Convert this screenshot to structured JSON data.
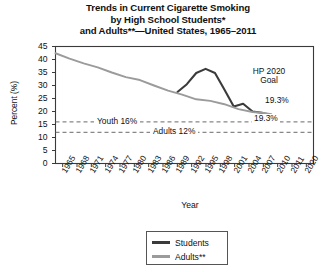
{
  "chart_data": {
    "type": "line",
    "title": "Trends in Current Cigarette Smoking by High School Students* and Adults**—United States, 1965–2011",
    "title_lines": [
      "Trends in Current Cigarette Smoking",
      "by High School Students*",
      "and Adults**—United States, 1965–2011"
    ],
    "xlabel": "Year",
    "ylabel": "Percent (%)",
    "ylim": [
      0,
      45
    ],
    "yticks": [
      0,
      5,
      10,
      15,
      20,
      25,
      30,
      35,
      40,
      45
    ],
    "ytick_labels": [
      "0",
      "5",
      "10",
      "15",
      "20",
      "25",
      "30",
      "35",
      "40",
      "45"
    ],
    "xlim": [
      1965,
      2020
    ],
    "xtick_labels": [
      "1965",
      "1968",
      "1971",
      "1974",
      "1977",
      "1980",
      "1983",
      "1986",
      "1989",
      "1992",
      "1995",
      "1998",
      "2001",
      "2004",
      "2007",
      "2010",
      "2011",
      "2020"
    ],
    "grid": false,
    "legend_position": "bottom-center",
    "series": [
      {
        "name": "Students",
        "color": "#3b3b3b",
        "points": [
          [
            1991,
            27.5
          ],
          [
            1993,
            30.5
          ],
          [
            1995,
            34.8
          ],
          [
            1997,
            36.4
          ],
          [
            1999,
            34.8
          ],
          [
            2001,
            28.5
          ],
          [
            2003,
            21.9
          ],
          [
            2005,
            23.0
          ],
          [
            2007,
            20.0
          ],
          [
            2009,
            19.5
          ],
          [
            2011,
            18.1
          ]
        ]
      },
      {
        "name": "Adults**",
        "color": "#9b9b9b",
        "points": [
          [
            1965,
            42.4
          ],
          [
            1968,
            40.3
          ],
          [
            1971,
            38.5
          ],
          [
            1974,
            37.0
          ],
          [
            1977,
            35.0
          ],
          [
            1980,
            33.2
          ],
          [
            1983,
            32.1
          ],
          [
            1986,
            30.0
          ],
          [
            1989,
            28.0
          ],
          [
            1992,
            26.5
          ],
          [
            1995,
            24.7
          ],
          [
            1998,
            24.1
          ],
          [
            2001,
            22.8
          ],
          [
            2004,
            20.9
          ],
          [
            2007,
            19.8
          ],
          [
            2010,
            19.3
          ],
          [
            2011,
            19.0
          ]
        ]
      }
    ],
    "reference_lines": [
      {
        "label": "Youth 16%",
        "value": 16
      },
      {
        "label": "Adults 12%",
        "value": 12
      }
    ],
    "annotations": [
      {
        "name": "hp-2020-goal",
        "text_lines": [
          "HP 2020",
          "Goal"
        ]
      },
      {
        "name": "students-endpoint-value",
        "text": "19.3%"
      },
      {
        "name": "adults-endpoint-value",
        "text": "19.3%"
      }
    ]
  },
  "legend": {
    "items": [
      {
        "label": "Students",
        "color": "#3b3b3b"
      },
      {
        "label": "Adults**",
        "color": "#9b9b9b"
      }
    ]
  }
}
